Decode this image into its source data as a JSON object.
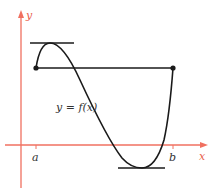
{
  "diagram": {
    "axes": {
      "x_label": "x",
      "y_label": "y",
      "color": "#f07060"
    },
    "curve": {
      "label": "y = f(x)",
      "color": "#1a1a1a"
    },
    "points": {
      "a_label": "a",
      "b_label": "b"
    },
    "lines": {
      "secant": "line through (a, f(a)) and (b, f(b))",
      "tangent_top": "horizontal tangent at local maximum",
      "tangent_bottom": "horizontal tangent at local minimum"
    }
  }
}
